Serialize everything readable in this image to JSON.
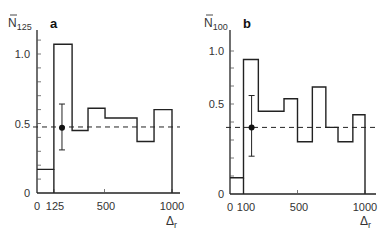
{
  "chart_data": [
    {
      "type": "bar",
      "style": "step-histogram",
      "panel": "a",
      "ylabel": "N̄",
      "ylabel_sub": "125",
      "xlabel": "Δ",
      "xlabel_sub": "r",
      "xlim": [
        0,
        1000
      ],
      "ylim": [
        0,
        1.1
      ],
      "x_ticks": [
        0,
        125,
        500,
        1000
      ],
      "y_ticks": [
        0,
        0.5,
        1.0
      ],
      "y_tick_labels": [
        "0",
        "0.5",
        "1.0"
      ],
      "bins": [
        [
          0,
          125
        ],
        [
          125,
          260
        ],
        [
          260,
          378
        ],
        [
          378,
          504
        ],
        [
          504,
          741
        ],
        [
          741,
          867
        ],
        [
          867,
          1000
        ]
      ],
      "values": [
        0.17,
        1.07,
        0.45,
        0.61,
        0.54,
        0.37,
        0.6
      ],
      "reference_line": {
        "style": "dashed",
        "y": 0.475
      },
      "mean_point": {
        "x": 185,
        "y": 0.47,
        "err_low": 0.31,
        "err_high": 0.64
      }
    },
    {
      "type": "bar",
      "style": "step-histogram",
      "panel": "b",
      "ylabel": "N̄",
      "ylabel_sub": "100",
      "xlabel": "Δ",
      "xlabel_sub": "r",
      "xlim": [
        0,
        1000
      ],
      "ylim": [
        0,
        1.0
      ],
      "x_ticks": [
        0,
        100,
        500,
        1000
      ],
      "y_ticks": [
        0,
        0.5,
        1.0
      ],
      "y_tick_labels": [
        "0",
        "0.5",
        "1.0"
      ],
      "bins": [
        [
          0,
          100
        ],
        [
          100,
          210
        ],
        [
          210,
          400
        ],
        [
          400,
          500
        ],
        [
          500,
          610
        ],
        [
          610,
          710
        ],
        [
          710,
          800
        ],
        [
          800,
          910
        ],
        [
          910,
          1000
        ]
      ],
      "values": [
        0.09,
        0.92,
        0.46,
        0.55,
        0.29,
        0.66,
        0.37,
        0.29,
        0.44
      ],
      "reference_line": {
        "style": "dashed",
        "y": 0.37
      },
      "mean_point": {
        "x": 160,
        "y": 0.37,
        "err_low": 0.21,
        "err_high": 0.58
      }
    }
  ],
  "labels": {
    "a": {
      "letter": "a",
      "ylabel": "N",
      "ylabel_sub": "125",
      "x0": "0",
      "x1": "125",
      "x2": "500",
      "x3": "1000",
      "y0": "0",
      "y1": "0.5",
      "y2": "1.0",
      "xlabel": "Δ",
      "xlabel_sub": "r"
    },
    "b": {
      "letter": "b",
      "ylabel": "N",
      "ylabel_sub": "100",
      "x0": "0",
      "x1": "100",
      "x2": "500",
      "x3": "1000",
      "y0": "0",
      "y1": "0.5",
      "y2": "1.0",
      "xlabel": "Δ",
      "xlabel_sub": "r"
    }
  }
}
